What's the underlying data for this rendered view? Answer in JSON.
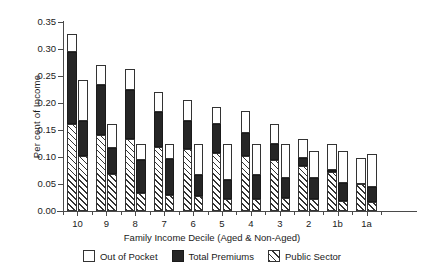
{
  "chart_data": {
    "type": "bar",
    "subtype": "grouped-stacked",
    "title": "",
    "xlabel": "Family Income Decile (Aged & Non-Aged)",
    "ylabel": "Per cent of Income",
    "ylim": [
      0.0,
      0.35
    ],
    "ytick_labels": [
      "0.00",
      "0.05",
      "0.10",
      "0.15",
      "0.20",
      "0.25",
      "0.30",
      "0.35"
    ],
    "ytick_values": [
      0.0,
      0.05,
      0.1,
      0.15,
      0.2,
      0.25,
      0.3,
      0.35
    ],
    "grid": false,
    "legend_position": "bottom",
    "categories": [
      "10",
      "9",
      "8",
      "7",
      "6",
      "5",
      "4",
      "3",
      "2",
      "1b",
      "1a"
    ],
    "group_members": [
      "Aged",
      "Non-Aged"
    ],
    "stack_order_bottom_to_top": [
      "Public Sector",
      "Total Premiums",
      "Out of Pocket"
    ],
    "series": [
      {
        "name": "Public Sector",
        "color": "#ffffff",
        "pattern": "diagonal-hatch",
        "aged": [
          0.162,
          0.14,
          0.133,
          0.119,
          0.114,
          0.107,
          0.102,
          0.095,
          0.084,
          0.073,
          0.05
        ],
        "non_aged": [
          0.101,
          0.068,
          0.034,
          0.029,
          0.027,
          0.023,
          0.023,
          0.024,
          0.022,
          0.019,
          0.016
        ]
      },
      {
        "name": "Total Premiums",
        "color": "#262626",
        "pattern": "solid",
        "aged": [
          0.133,
          0.094,
          0.092,
          0.064,
          0.053,
          0.055,
          0.043,
          0.029,
          0.014,
          0.003,
          0.0
        ],
        "non_aged": [
          0.066,
          0.049,
          0.061,
          0.067,
          0.04,
          0.035,
          0.043,
          0.038,
          0.039,
          0.033,
          0.029
        ]
      },
      {
        "name": "Out of Pocket",
        "color": "#ffffff",
        "pattern": "solid",
        "aged": [
          0.033,
          0.037,
          0.038,
          0.037,
          0.038,
          0.031,
          0.041,
          0.038,
          0.035,
          0.049,
          0.049
        ],
        "non_aged": [
          0.075,
          0.044,
          0.03,
          0.029,
          0.058,
          0.067,
          0.059,
          0.063,
          0.05,
          0.06,
          0.06
        ]
      }
    ],
    "bar_totals": {
      "aged": [
        0.328,
        0.271,
        0.263,
        0.22,
        0.205,
        0.193,
        0.186,
        0.162,
        0.133,
        0.125,
        0.099
      ],
      "non_aged": [
        0.242,
        0.161,
        0.125,
        0.125,
        0.125,
        0.125,
        0.125,
        0.125,
        0.111,
        0.112,
        0.105
      ]
    }
  },
  "legend": {
    "items": [
      {
        "label": "Out of Pocket",
        "swatch": "out"
      },
      {
        "label": "Total Premiums",
        "swatch": "prem"
      },
      {
        "label": "Public Sector",
        "swatch": "pub"
      }
    ]
  }
}
